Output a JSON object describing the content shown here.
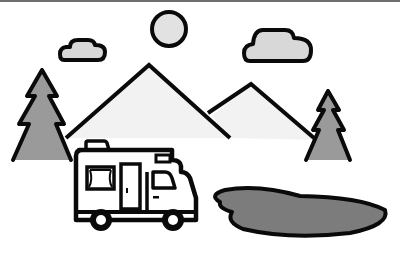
{
  "scene": {
    "title": "Camper van in mountain landscape",
    "elements": [
      "sun",
      "cloud-left",
      "cloud-right",
      "mountain-large",
      "mountain-small",
      "tree-left",
      "tree-right",
      "camper-van",
      "lake"
    ],
    "colors": {
      "outline": "#0a0a0a",
      "sun_fill": "#e2e2e2",
      "cloud_fill": "#d8d8d8",
      "mountain_fill": "#f2f2f2",
      "tree_fill": "#9a9a9a",
      "lake_fill": "#7c7c7c",
      "topbar": "#6e6e6e"
    }
  }
}
